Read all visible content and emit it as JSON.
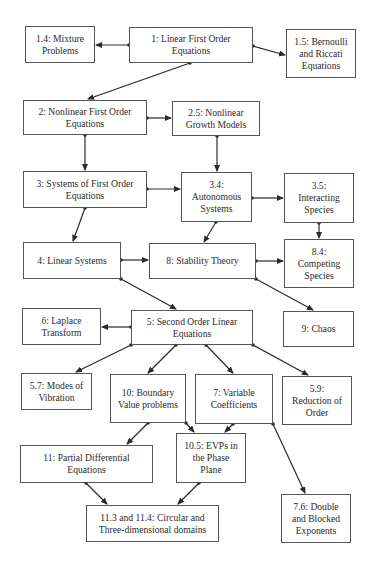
{
  "diagram": {
    "type": "concept-map",
    "nodes": [
      {
        "id": "n1_4",
        "label": "1.4: Mixture\nProblems",
        "box": [
          25,
          26,
          70,
          37
        ]
      },
      {
        "id": "n1",
        "label": "1: Linear First Order\nEquations",
        "box": [
          129,
          27,
          124,
          36
        ]
      },
      {
        "id": "n1_5",
        "label": "1.5: Bernoulli\nand Riccati\nEquations",
        "box": [
          286,
          29,
          70,
          49
        ]
      },
      {
        "id": "n2",
        "label": "2: Nonlinear First Order\nEquations",
        "box": [
          23,
          100,
          124,
          35
        ]
      },
      {
        "id": "n2_5",
        "label": "2.5: Nonlinear\nGrowth Models",
        "box": [
          172,
          101,
          88,
          35
        ]
      },
      {
        "id": "n3",
        "label": "3: Systems of First Order\nEquations",
        "box": [
          23,
          171,
          124,
          37
        ]
      },
      {
        "id": "n3_4",
        "label": "3.4:\nAutonomous\nSystems",
        "box": [
          181,
          172,
          71,
          50
        ]
      },
      {
        "id": "n3_5",
        "label": "3.5:\nInteracting\nSpecies",
        "box": [
          284,
          173,
          70,
          50
        ]
      },
      {
        "id": "n4",
        "label": "4: Linear Systems",
        "box": [
          23,
          242,
          98,
          37
        ]
      },
      {
        "id": "n8",
        "label": "8: Stability Theory",
        "box": [
          149,
          243,
          107,
          36
        ]
      },
      {
        "id": "n8_4",
        "label": "8.4:\nCompeting\nSpecies",
        "box": [
          284,
          239,
          70,
          49
        ]
      },
      {
        "id": "n6",
        "label": "6: Laplace\nTransform",
        "box": [
          22,
          308,
          79,
          37
        ]
      },
      {
        "id": "n5",
        "label": "5: Second Order Linear\nEquations",
        "box": [
          131,
          310,
          122,
          35
        ]
      },
      {
        "id": "n9",
        "label": "9: Chaos",
        "box": [
          283,
          311,
          71,
          36
        ]
      },
      {
        "id": "n5_7",
        "label": "5.7: Modes of\nVibration",
        "box": [
          21,
          373,
          71,
          37
        ]
      },
      {
        "id": "n10",
        "label": "10: Boundary\nValue problems",
        "box": [
          110,
          374,
          76,
          49
        ]
      },
      {
        "id": "n7",
        "label": "7: Variable\nCoefficients",
        "box": [
          195,
          374,
          78,
          50
        ]
      },
      {
        "id": "n5_9",
        "label": "5.9:\nReduction of\nOrder",
        "box": [
          282,
          376,
          70,
          49
        ]
      },
      {
        "id": "n11",
        "label": "11: Partial Differential\nEquations",
        "box": [
          20,
          445,
          133,
          38
        ]
      },
      {
        "id": "n10_5",
        "label": "10.5: EVPs in\nthe Phase\nPlane",
        "box": [
          176,
          433,
          70,
          50
        ]
      },
      {
        "id": "n11_3",
        "label": "11.3 and 11.4: Circular and\nThree-dimensional domains",
        "box": [
          86,
          505,
          133,
          37
        ]
      },
      {
        "id": "n7_6",
        "label": "7.6: Double\nand Blocked\nExponents",
        "box": [
          281,
          494,
          70,
          49
        ]
      }
    ],
    "edges": [
      {
        "from": "n1",
        "to": "n1_4",
        "start": [
          129,
          45
        ],
        "end": [
          96,
          45
        ]
      },
      {
        "from": "n1",
        "to": "n1_5",
        "start": [
          253,
          46
        ],
        "end": [
          285,
          55
        ]
      },
      {
        "from": "n1",
        "to": "n2",
        "start": [
          190,
          63
        ],
        "end": [
          88,
          99
        ]
      },
      {
        "from": "n2",
        "to": "n2_5",
        "start": [
          147,
          118
        ],
        "end": [
          171,
          118
        ]
      },
      {
        "from": "n2",
        "to": "n3",
        "start": [
          85,
          135
        ],
        "end": [
          85,
          170
        ]
      },
      {
        "from": "n2_5",
        "to": "n3_4",
        "start": [
          217,
          136
        ],
        "end": [
          217,
          171
        ]
      },
      {
        "from": "n3",
        "to": "n3_4",
        "start": [
          147,
          189
        ],
        "end": [
          180,
          189
        ]
      },
      {
        "from": "n3_4",
        "to": "n3_5",
        "start": [
          252,
          198
        ],
        "end": [
          283,
          198
        ]
      },
      {
        "from": "n3",
        "to": "n4",
        "start": [
          85,
          208
        ],
        "end": [
          73,
          241
        ]
      },
      {
        "from": "n3_4",
        "to": "n8",
        "start": [
          216,
          222
        ],
        "end": [
          204,
          242
        ]
      },
      {
        "from": "n3_5",
        "to": "n8_4",
        "start": [
          319,
          223
        ],
        "end": [
          319,
          238
        ]
      },
      {
        "from": "n4",
        "to": "n8",
        "start": [
          121,
          260
        ],
        "end": [
          148,
          260
        ]
      },
      {
        "from": "n8",
        "to": "n8_4",
        "start": [
          256,
          261
        ],
        "end": [
          283,
          261
        ]
      },
      {
        "from": "n4",
        "to": "n5",
        "start": [
          121,
          279
        ],
        "end": [
          176,
          309
        ]
      },
      {
        "from": "n8",
        "to": "n9",
        "start": [
          256,
          279
        ],
        "end": [
          313,
          310
        ]
      },
      {
        "from": "n5",
        "to": "n6",
        "start": [
          131,
          327
        ],
        "end": [
          102,
          327
        ]
      },
      {
        "from": "n5",
        "to": "n5_7",
        "start": [
          131,
          345
        ],
        "end": [
          76,
          372
        ]
      },
      {
        "from": "n5",
        "to": "n10",
        "start": [
          176,
          345
        ],
        "end": [
          148,
          373
        ]
      },
      {
        "from": "n5",
        "to": "n7",
        "start": [
          206,
          345
        ],
        "end": [
          233,
          373
        ]
      },
      {
        "from": "n5",
        "to": "n5_9",
        "start": [
          253,
          345
        ],
        "end": [
          308,
          375
        ]
      },
      {
        "from": "n10",
        "to": "n11",
        "start": [
          148,
          423
        ],
        "end": [
          127,
          444
        ]
      },
      {
        "from": "n10",
        "to": "n10_5",
        "start": [
          186,
          423
        ],
        "end": [
          194,
          432
        ]
      },
      {
        "from": "n7",
        "to": "n10_5",
        "start": [
          233,
          424
        ],
        "end": [
          225,
          432
        ]
      },
      {
        "from": "n7",
        "to": "n7_6",
        "start": [
          273,
          424
        ],
        "end": [
          305,
          493
        ]
      },
      {
        "from": "n11",
        "to": "n11_3",
        "start": [
          86,
          483
        ],
        "end": [
          107,
          504
        ]
      },
      {
        "from": "n10_5",
        "to": "n11_3",
        "start": [
          199,
          483
        ],
        "end": [
          178,
          504
        ]
      }
    ],
    "colors": {
      "line": "#2a2a2a",
      "border": "#555555",
      "background": "#ffffff"
    }
  }
}
